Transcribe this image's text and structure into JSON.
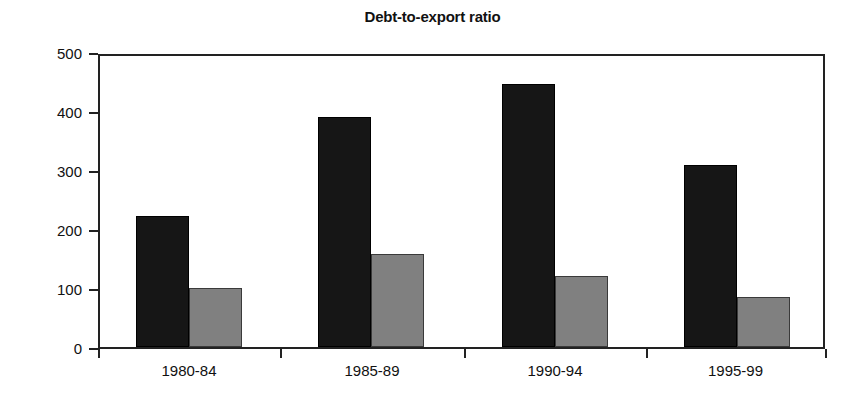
{
  "chart_data": {
    "type": "bar",
    "title": "Debt-to-export ratio",
    "xlabel": "",
    "ylabel": "",
    "categories": [
      "1980-84",
      "1985-89",
      "1990-94",
      "1995-99"
    ],
    "series": [
      {
        "name": "series-1",
        "color": "#161616",
        "values": [
          222,
          390,
          445,
          308
        ]
      },
      {
        "name": "series-2",
        "color": "#808080",
        "values": [
          100,
          158,
          120,
          85
        ]
      }
    ],
    "ylim": [
      0,
      500
    ],
    "yticks": [
      0,
      100,
      200,
      300,
      400,
      500
    ],
    "ytick_labels": [
      "0",
      "100",
      "200",
      "300",
      "400",
      "500"
    ],
    "grid": false,
    "legend": "none",
    "frame": true
  },
  "axis": {
    "y_labels": [
      "500",
      "400",
      "300",
      "200",
      "100",
      "0"
    ],
    "x_labels": [
      "1980-84",
      "1985-89",
      "1990-94",
      "1995-99"
    ]
  }
}
